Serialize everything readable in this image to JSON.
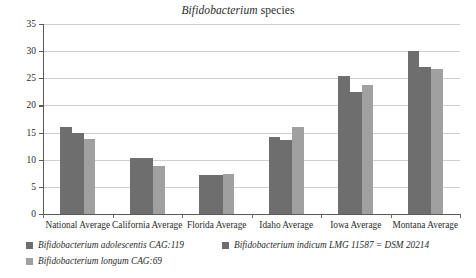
{
  "chart_data": {
    "type": "bar",
    "title": "Bifidobacterium species",
    "title_genus": "Bifidobacterium",
    "title_rest": " species",
    "xlabel": "",
    "ylabel": "",
    "ylim": [
      0,
      35
    ],
    "ytick_step": 5,
    "grid": true,
    "legend_position": "bottom-left",
    "categories": [
      "National Average",
      "California Average",
      "Florida Average",
      "Idaho Average",
      "Iowa Average",
      "Montana Average"
    ],
    "yticks": [
      "0",
      "5",
      "10",
      "15",
      "20",
      "25",
      "30",
      "35"
    ],
    "series": [
      {
        "name": "Bifidobacterium adolescentis CAG:119",
        "color": "#6e6e6e",
        "values": [
          16.1,
          10.3,
          7.2,
          14.1,
          25.4,
          30.0
        ]
      },
      {
        "name": "Bifidobacterium indicum LMG 11587 = DSM 20214",
        "color": "#6e6e6e",
        "values": [
          15.0,
          10.3,
          7.1,
          13.7,
          22.4,
          27.0
        ]
      },
      {
        "name": "Bifidobacterium longum CAG:69",
        "color": "#a0a0a0",
        "values": [
          13.8,
          8.8,
          7.4,
          16.1,
          23.7,
          26.7
        ]
      }
    ]
  },
  "legend": {
    "items": [
      {
        "label": "Bifidobacterium adolescentis CAG:119",
        "color": "#6e6e6e"
      },
      {
        "label": "Bifidobacterium indicum LMG 11587 = DSM 20214",
        "color": "#6e6e6e"
      },
      {
        "label": "Bifidobacterium longum CAG:69",
        "color": "#a0a0a0"
      }
    ]
  },
  "colors": {
    "series_dark": "#6e6e6e",
    "series_light": "#a0a0a0",
    "axis": "#595959",
    "grid": "#cfcfcf",
    "text": "#2b2b2b",
    "background": "#ffffff"
  }
}
